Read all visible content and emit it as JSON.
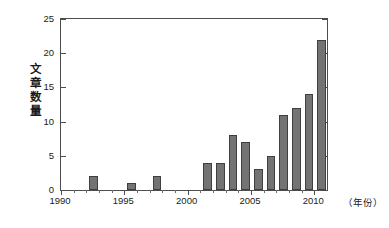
{
  "chart_data": {
    "type": "bar",
    "title": "",
    "subtitle": "",
    "xlabel": "（年份）",
    "ylabel": "文章数量",
    "xlim": [
      1990,
      2011
    ],
    "ylim": [
      0,
      25
    ],
    "grid": false,
    "legend": null,
    "bar_color": "#737373",
    "bar_edge_color": "#3f3f3f",
    "axis_color": "#4d4d4d",
    "y_ticks": [
      0,
      5,
      10,
      15,
      20,
      25
    ],
    "y_tick_labels": [
      "0",
      "5",
      "10",
      "15",
      "20",
      "25"
    ],
    "x_ticks": [
      1990,
      1995,
      2000,
      2005,
      2010
    ],
    "x_tick_labels": [
      "1990",
      "1995",
      "2000",
      "2005",
      "2010"
    ],
    "categories": [
      1990,
      1991,
      1992,
      1993,
      1994,
      1995,
      1996,
      1997,
      1998,
      1999,
      2000,
      2001,
      2002,
      2003,
      2004,
      2005,
      2006,
      2007,
      2008,
      2009,
      2010
    ],
    "values": [
      0,
      0,
      2,
      0,
      0,
      1,
      0,
      2,
      0,
      0,
      0,
      4,
      4,
      8,
      7,
      3,
      5,
      11,
      12,
      14,
      22
    ],
    "points": [
      {
        "year": 1990,
        "count": 0
      },
      {
        "year": 1991,
        "count": 0
      },
      {
        "year": 1992,
        "count": 2
      },
      {
        "year": 1993,
        "count": 0
      },
      {
        "year": 1994,
        "count": 0
      },
      {
        "year": 1995,
        "count": 1
      },
      {
        "year": 1996,
        "count": 0
      },
      {
        "year": 1997,
        "count": 2
      },
      {
        "year": 1998,
        "count": 0
      },
      {
        "year": 1999,
        "count": 0
      },
      {
        "year": 2000,
        "count": 0
      },
      {
        "year": 2001,
        "count": 4
      },
      {
        "year": 2002,
        "count": 4
      },
      {
        "year": 2003,
        "count": 8
      },
      {
        "year": 2004,
        "count": 7
      },
      {
        "year": 2005,
        "count": 3
      },
      {
        "year": 2006,
        "count": 5
      },
      {
        "year": 2007,
        "count": 11
      },
      {
        "year": 2008,
        "count": 12
      },
      {
        "year": 2009,
        "count": 14
      },
      {
        "year": 2010,
        "count": 22
      }
    ]
  }
}
